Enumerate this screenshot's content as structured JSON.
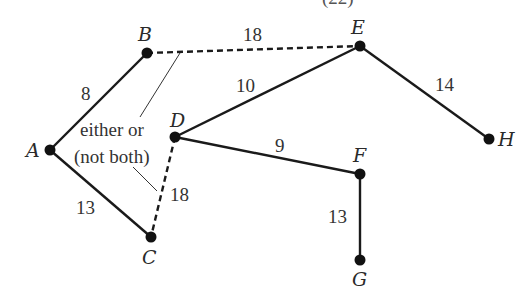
{
  "diagram": {
    "type": "weighted-graph",
    "top_fragment": "(22)",
    "nodes": [
      {
        "id": "A",
        "label": "A",
        "x": 50,
        "y": 150
      },
      {
        "id": "B",
        "label": "B",
        "x": 147,
        "y": 53
      },
      {
        "id": "C",
        "label": "C",
        "x": 151,
        "y": 237
      },
      {
        "id": "D",
        "label": "D",
        "x": 175,
        "y": 137
      },
      {
        "id": "E",
        "label": "E",
        "x": 360,
        "y": 46
      },
      {
        "id": "F",
        "label": "F",
        "x": 360,
        "y": 174
      },
      {
        "id": "G",
        "label": "G",
        "x": 360,
        "y": 260
      },
      {
        "id": "H",
        "label": "H",
        "x": 489,
        "y": 139
      }
    ],
    "edges": [
      {
        "from": "A",
        "to": "B",
        "weight": "8",
        "style": "solid"
      },
      {
        "from": "A",
        "to": "C",
        "weight": "13",
        "style": "solid"
      },
      {
        "from": "B",
        "to": "E",
        "weight": "18",
        "style": "dashed"
      },
      {
        "from": "D",
        "to": "C",
        "weight": "18",
        "style": "dashed"
      },
      {
        "from": "D",
        "to": "E",
        "weight": "10",
        "style": "solid"
      },
      {
        "from": "D",
        "to": "F",
        "weight": "9",
        "style": "solid"
      },
      {
        "from": "E",
        "to": "H",
        "weight": "14",
        "style": "solid"
      },
      {
        "from": "F",
        "to": "G",
        "weight": "13",
        "style": "solid"
      }
    ],
    "annotation": {
      "line1": "either or",
      "line2": "(not both)",
      "refers_to": [
        "B-E",
        "D-C"
      ]
    }
  }
}
